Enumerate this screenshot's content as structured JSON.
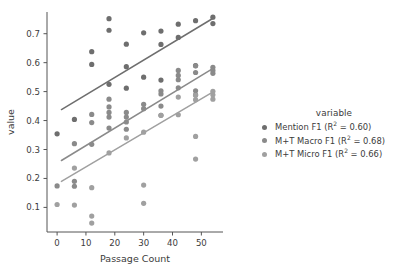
{
  "chart_data": {
    "type": "scatter",
    "title": "",
    "xlabel": "Passage Count",
    "ylabel": "value",
    "xlim": [
      -3.5,
      57.5
    ],
    "ylim": [
      0.015,
      0.775
    ],
    "xticks": [
      0,
      10,
      20,
      30,
      40,
      50
    ],
    "yticks": [
      0.1,
      0.2,
      0.3,
      0.4,
      0.5,
      0.6,
      0.7
    ],
    "xtick_labels": [
      "0",
      "10",
      "20",
      "30",
      "40",
      "50"
    ],
    "ytick_labels": [
      "0.1",
      "0.2",
      "0.3",
      "0.4",
      "0.5",
      "0.6",
      "0.7"
    ],
    "grid": false,
    "legend_position": "right",
    "legend_title": "variable",
    "marker_size": 4,
    "series": [
      {
        "name": "Mention F1 (R² = 0.60)",
        "r_squared": 0.6,
        "color": "#6e6e6e",
        "points": [
          [
            0,
            0.354
          ],
          [
            6,
            0.404
          ],
          [
            12,
            0.638
          ],
          [
            12,
            0.594
          ],
          [
            18,
            0.752
          ],
          [
            18,
            0.712
          ],
          [
            18,
            0.525
          ],
          [
            24,
            0.664
          ],
          [
            24,
            0.586
          ],
          [
            24,
            0.512
          ],
          [
            30,
            0.703
          ],
          [
            30,
            0.55
          ],
          [
            36,
            0.709
          ],
          [
            36,
            0.663
          ],
          [
            36,
            0.54
          ],
          [
            42,
            0.733
          ],
          [
            42,
            0.687
          ],
          [
            48,
            0.745
          ],
          [
            48,
            0.59
          ],
          [
            54,
            0.757
          ],
          [
            54,
            0.735
          ]
        ],
        "trend_line": {
          "x0": 1.5,
          "y0": 0.438,
          "x1": 54.5,
          "y1": 0.756
        }
      },
      {
        "name": "M+T Macro F1 (R² = 0.68)",
        "r_squared": 0.68,
        "color": "#8a8a8a",
        "points": [
          [
            0,
            0.174
          ],
          [
            6,
            0.32
          ],
          [
            6,
            0.19
          ],
          [
            6,
            0.173
          ],
          [
            12,
            0.421
          ],
          [
            12,
            0.393
          ],
          [
            12,
            0.318
          ],
          [
            18,
            0.474
          ],
          [
            18,
            0.447
          ],
          [
            18,
            0.428
          ],
          [
            18,
            0.412
          ],
          [
            18,
            0.374
          ],
          [
            24,
            0.428
          ],
          [
            24,
            0.412
          ],
          [
            24,
            0.395
          ],
          [
            24,
            0.37
          ],
          [
            30,
            0.456
          ],
          [
            30,
            0.441
          ],
          [
            36,
            0.503
          ],
          [
            36,
            0.492
          ],
          [
            36,
            0.45
          ],
          [
            36,
            0.418
          ],
          [
            42,
            0.573
          ],
          [
            42,
            0.556
          ],
          [
            42,
            0.541
          ],
          [
            42,
            0.513
          ],
          [
            48,
            0.589
          ],
          [
            48,
            0.566
          ],
          [
            48,
            0.503
          ],
          [
            48,
            0.489
          ],
          [
            54,
            0.584
          ],
          [
            54,
            0.573
          ],
          [
            54,
            0.563
          ]
        ],
        "trend_line": {
          "x0": 1.5,
          "y0": 0.262,
          "x1": 54.5,
          "y1": 0.583
        }
      },
      {
        "name": "M+T Micro F1 (R² = 0.66)",
        "r_squared": 0.66,
        "color": "#a0a0a0",
        "points": [
          [
            0,
            0.11
          ],
          [
            6,
            0.236
          ],
          [
            6,
            0.108
          ],
          [
            12,
            0.168
          ],
          [
            12,
            0.07
          ],
          [
            12,
            0.046
          ],
          [
            18,
            0.288
          ],
          [
            24,
            0.34
          ],
          [
            30,
            0.36
          ],
          [
            30,
            0.177
          ],
          [
            30,
            0.114
          ],
          [
            36,
            0.418
          ],
          [
            42,
            0.481
          ],
          [
            42,
            0.42
          ],
          [
            48,
            0.487
          ],
          [
            48,
            0.472
          ],
          [
            48,
            0.345
          ],
          [
            48,
            0.267
          ],
          [
            54,
            0.501
          ],
          [
            54,
            0.489
          ],
          [
            54,
            0.474
          ]
        ],
        "trend_line": {
          "x0": 1.5,
          "y0": 0.19,
          "x1": 54.5,
          "y1": 0.502
        }
      }
    ]
  },
  "legend": {
    "title": "variable",
    "entries": [
      {
        "label": "Mention F1 (R² = 0.60)",
        "color": "#6e6e6e"
      },
      {
        "label": "M+T Macro F1 (R² = 0.68)",
        "color": "#8a8a8a"
      },
      {
        "label": "M+T Micro F1 (R² = 0.66)",
        "color": "#a0a0a0"
      }
    ]
  },
  "axes": {
    "xlabel": "Passage Count",
    "ylabel": "value"
  }
}
